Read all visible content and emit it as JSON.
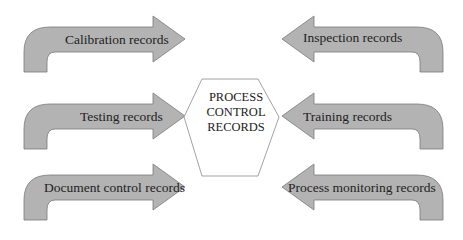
{
  "diagram": {
    "center": {
      "lines": [
        "PROCESS",
        "CONTROL",
        "RECORDS"
      ]
    },
    "left_arrows": [
      {
        "label": "Calibration records",
        "direction": "right"
      },
      {
        "label": "Testing records",
        "direction": "right"
      },
      {
        "label": "Document control records",
        "direction": "right"
      }
    ],
    "right_arrows": [
      {
        "label": "Inspection records",
        "direction": "left"
      },
      {
        "label": "Training records",
        "direction": "left"
      },
      {
        "label": "Process monitoring records",
        "direction": "left"
      }
    ],
    "colors": {
      "arrow_fill": "#b3b3b3",
      "arrow_stroke": "#7a7a7a",
      "hexagon_stroke": "#8a8a8a",
      "text": "#222222"
    }
  }
}
